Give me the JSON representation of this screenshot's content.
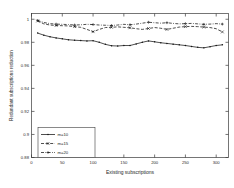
{
  "chart_data": {
    "type": "line",
    "title": "",
    "xlabel": "Existing subscriptions",
    "ylabel": "Redundant subscriptions reduction",
    "xlim": [
      0,
      320
    ],
    "ylim": [
      0.88,
      1.005
    ],
    "xticks": [
      0,
      50,
      100,
      150,
      200,
      250,
      300
    ],
    "yticks": [
      0.88,
      0.9,
      0.92,
      0.94,
      0.96,
      0.98,
      1
    ],
    "xticklabels": [
      "0",
      "50",
      "100",
      "150",
      "200",
      "250",
      "300"
    ],
    "yticklabels": [
      "0.88",
      "0.9",
      "0.92",
      "0.94",
      "0.96",
      "0.98",
      "1"
    ],
    "grid": false,
    "legend_position": "lower-left",
    "x": [
      10,
      20,
      30,
      40,
      50,
      60,
      70,
      80,
      90,
      100,
      110,
      120,
      130,
      140,
      150,
      160,
      170,
      180,
      190,
      200,
      210,
      220,
      230,
      240,
      250,
      260,
      270,
      280,
      290,
      300,
      310
    ],
    "series": [
      {
        "name": "m=10",
        "label": "m=10",
        "linestyle": "solid",
        "marker": "dot",
        "color": "#141414",
        "values": [
          0.988,
          0.9862,
          0.9848,
          0.9838,
          0.983,
          0.9822,
          0.9818,
          0.9815,
          0.9812,
          0.9814,
          0.98,
          0.9782,
          0.977,
          0.9768,
          0.9772,
          0.9772,
          0.9786,
          0.98,
          0.9812,
          0.9804,
          0.9796,
          0.979,
          0.9784,
          0.9778,
          0.9772,
          0.9764,
          0.9756,
          0.9752,
          0.9762,
          0.9772,
          0.9778
        ]
      },
      {
        "name": "m=15",
        "label": "m=15",
        "linestyle": "dashed",
        "marker": "cross",
        "color": "#141414",
        "values": [
          0.9985,
          0.996,
          0.995,
          0.9946,
          0.9944,
          0.9942,
          0.9936,
          0.993,
          0.9912,
          0.9892,
          0.9912,
          0.9928,
          0.993,
          0.9934,
          0.993,
          0.9926,
          0.9918,
          0.9912,
          0.992,
          0.9928,
          0.9922,
          0.9912,
          0.9922,
          0.9932,
          0.9936,
          0.9938,
          0.9936,
          0.9932,
          0.9928,
          0.9918,
          0.989
        ]
      },
      {
        "name": "m=20",
        "label": "m=20",
        "linestyle": "dashdot",
        "marker": "plus",
        "color": "#141414",
        "values": [
          0.999,
          0.9972,
          0.9962,
          0.9958,
          0.9956,
          0.9954,
          0.995,
          0.9952,
          0.9956,
          0.9954,
          0.995,
          0.9948,
          0.9946,
          0.995,
          0.9956,
          0.9952,
          0.9958,
          0.9966,
          0.9974,
          0.997,
          0.9966,
          0.997,
          0.9964,
          0.996,
          0.9962,
          0.9964,
          0.996,
          0.9956,
          0.9958,
          0.9962,
          0.9958
        ]
      }
    ]
  }
}
